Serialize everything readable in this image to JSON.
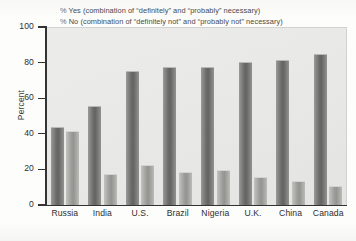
{
  "chart_data": {
    "type": "bar",
    "title": "",
    "subtitle": "",
    "xlabel": "",
    "ylabel": "Percent",
    "ylim": [
      0,
      100
    ],
    "ytick_step": 20,
    "yticks": [
      0,
      20,
      40,
      60,
      80,
      100
    ],
    "grid": false,
    "legend_position": "top",
    "categories": [
      "Russia",
      "India",
      "U.S.",
      "Brazil",
      "Nigeria",
      "U.K.",
      "China",
      "Canada"
    ],
    "series": [
      {
        "name": "% Yes",
        "legend_label": "% Yes (combination of “definitely” and “probably” necessary)",
        "color": "#6e6e6c",
        "values": [
          43,
          55,
          75,
          77,
          77,
          80,
          81,
          84
        ]
      },
      {
        "name": "% No",
        "legend_label": "% No (combination of “definitely not” and “probably not” necessary)",
        "color": "#9d9d9a",
        "values": [
          41,
          17,
          22,
          18,
          19,
          15,
          13,
          10
        ]
      }
    ]
  },
  "legend": {
    "rows": [
      {
        "pct": "%",
        "text": "Yes (combination of “definitely” and “probably” necessary)"
      },
      {
        "pct": "%",
        "text": "No (combination of “definitely not” and “probably not” necessary)"
      }
    ]
  },
  "colors": {
    "panel_background": "#ececeb",
    "axis": "#333333",
    "text": "#2e2e2e",
    "series_yes": "#6e6e6c",
    "series_no": "#9d9d9a"
  }
}
